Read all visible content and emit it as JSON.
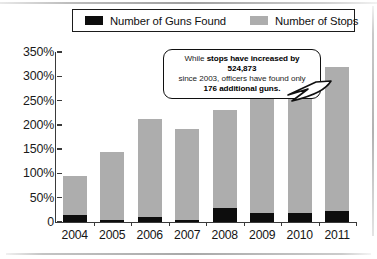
{
  "chart_data": {
    "type": "bar",
    "title": "",
    "subtitle": "",
    "xlabel": "",
    "ylabel": "",
    "categories": [
      "2004",
      "2005",
      "2006",
      "2007",
      "2008",
      "2009",
      "2010",
      "2011"
    ],
    "series": [
      {
        "name": "Number of Guns Found",
        "color": "#0d0d0d",
        "values": [
          14,
          5,
          10,
          5,
          28,
          18,
          18,
          23
        ]
      },
      {
        "name": "Number of Stops",
        "color": "#adadad",
        "values": [
          95,
          145,
          212,
          192,
          230,
          255,
          270,
          320
        ]
      }
    ],
    "ylim": [
      0,
      350
    ],
    "ytick_values": [
      0,
      50,
      100,
      150,
      200,
      250,
      300,
      350
    ],
    "ytick_labels": [
      "0",
      "50%",
      "100%",
      "150%",
      "200%",
      "250%",
      "300%",
      "350%"
    ],
    "grid": false,
    "legend_position": "top",
    "bar_mode": "overlay"
  },
  "legend": {
    "items": [
      {
        "label": "Number of Guns Found",
        "color": "#0d0d0d",
        "swatch_name": "legend-swatch-guns"
      },
      {
        "label": "Number of Stops",
        "color": "#adadad",
        "swatch_name": "legend-swatch-stops"
      }
    ]
  },
  "callout": {
    "line1_prefix": "While ",
    "line1_bold": "stops have increased by 524,873",
    "line2": "since 2003, officers have found only",
    "line3_bold": "176 additional guns."
  },
  "colors": {
    "stops_bar": "#adadad",
    "guns_bar": "#0d0d0d",
    "axis": "#3a3a3a",
    "text": "#151515",
    "background": "#ffffff"
  }
}
